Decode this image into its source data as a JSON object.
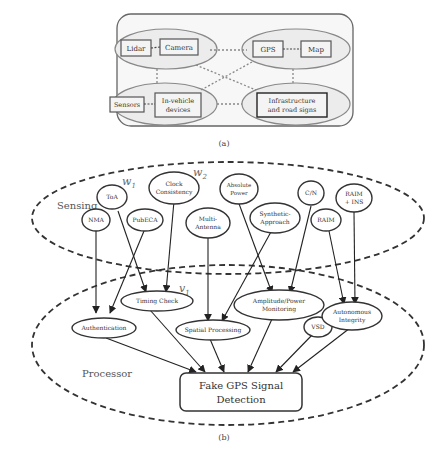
{
  "panel_a": {
    "caption": "(a)",
    "groups": [
      {
        "id": "tl",
        "nodes": [
          "Lidar",
          "Camera"
        ]
      },
      {
        "id": "tr",
        "nodes": [
          "GPS",
          "Map"
        ]
      },
      {
        "id": "bl",
        "nodes": [
          "Sensors",
          "In-vehicle devices"
        ]
      },
      {
        "id": "br",
        "nodes": [
          "Infrastructure and road signs"
        ]
      }
    ],
    "labels": {
      "lidar": "Lidar",
      "camera": "Camera",
      "gps": "GPS",
      "map": "Map",
      "sensors": "Sensors",
      "invehicle_1": "In-vehicle",
      "invehicle_2": "devices",
      "infra_1": "Infrastructure",
      "infra_2": "and road signs"
    }
  },
  "panel_b": {
    "caption": "(b)",
    "sensing_label": "Sensing",
    "processor_label": "Processor",
    "math_labels": {
      "w1": "w",
      "w1_sub": "1",
      "w2": "w",
      "w2_sub": "2",
      "v1": "v",
      "v1_sub": "1"
    },
    "sensing_nodes": {
      "toa": "ToA",
      "nma": "NMA",
      "pubca": "PubECA",
      "clock_1": "Clock",
      "clock_2": "Consistency",
      "multi_1": "Multi-",
      "multi_2": "Antenna",
      "abs_1": "Absolute",
      "abs_2": "Power",
      "synth_1": "Synthetic-",
      "synth_2": "Approach",
      "cn": "C/N",
      "raim": "RAIM",
      "raimins_1": "RAIM",
      "raimins_2": "+ INS"
    },
    "processor_nodes": {
      "timing": "Timing Check",
      "auth": "Authentication",
      "spatial": "Spatial Processing",
      "amp_1": "Amplitude/Power",
      "amp_2": "Monitoring",
      "vsd": "VSD",
      "auton_1": "Autonomous",
      "auton_2": "Integrity"
    },
    "output": {
      "line1": "Fake GPS Signal",
      "line2": "Detection"
    },
    "edges": [
      [
        "NMA",
        "Authentication"
      ],
      [
        "PubECA",
        "Authentication"
      ],
      [
        "ToA",
        "Timing Check"
      ],
      [
        "Clock Consistency",
        "Timing Check"
      ],
      [
        "Multi-Antenna",
        "Spatial Processing"
      ],
      [
        "Absolute Power",
        "Amplitude/Power Monitoring"
      ],
      [
        "Synthetic-Approach",
        "Spatial Processing"
      ],
      [
        "C/N",
        "Amplitude/Power Monitoring"
      ],
      [
        "RAIM",
        "Autonomous Integrity"
      ],
      [
        "RAIM + INS",
        "Autonomous Integrity"
      ],
      [
        "Authentication",
        "Fake GPS Signal Detection"
      ],
      [
        "Timing Check",
        "Fake GPS Signal Detection"
      ],
      [
        "Spatial Processing",
        "Fake GPS Signal Detection"
      ],
      [
        "Amplitude/Power Monitoring",
        "Fake GPS Signal Detection"
      ],
      [
        "VSD",
        "Fake GPS Signal Detection"
      ],
      [
        "Autonomous Integrity",
        "Fake GPS Signal Detection"
      ]
    ]
  }
}
